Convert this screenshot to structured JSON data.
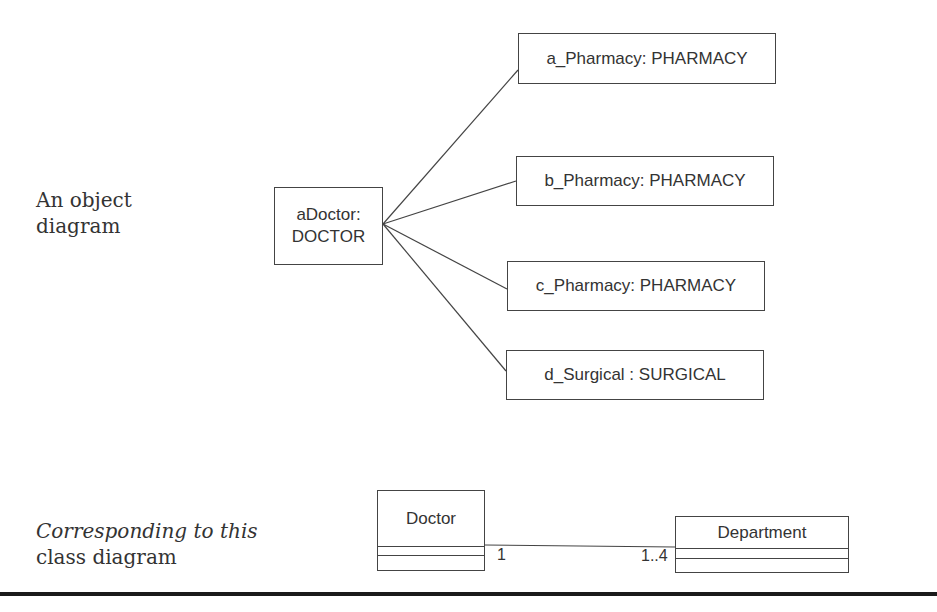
{
  "object_diagram": {
    "caption_line1": "An object",
    "caption_line2": "diagram",
    "central_object": {
      "line1": "aDoctor:",
      "line2": "DOCTOR"
    },
    "linked_objects": [
      {
        "label": "a_Pharmacy: PHARMACY"
      },
      {
        "label": "b_Pharmacy: PHARMACY"
      },
      {
        "label": "c_Pharmacy: PHARMACY"
      },
      {
        "label": "d_Surgical : SURGICAL"
      }
    ]
  },
  "class_diagram": {
    "caption_italic": "Corresponding to this",
    "caption_plain": "class diagram",
    "classes": [
      {
        "name": "Doctor"
      },
      {
        "name": "Department"
      }
    ],
    "association": {
      "source_multiplicity": "1",
      "target_multiplicity": "1..4"
    }
  },
  "colors": {
    "stroke": "#444444",
    "text": "#333333",
    "rule": "#1a1a1a"
  }
}
